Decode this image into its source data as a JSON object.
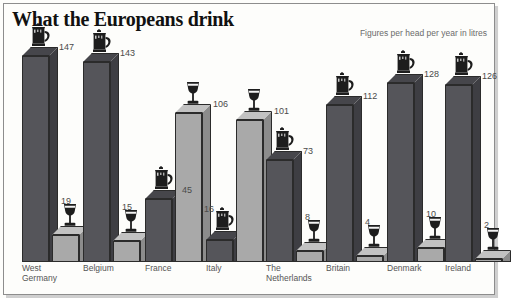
{
  "header": {
    "title": "What the Europeans drink",
    "caption": "Figures per head per year in litres"
  },
  "icons": {
    "beer": "beer-stein-icon",
    "wine": "wine-glass-icon"
  },
  "colors": {
    "beer_face": "#55555a",
    "beer_side": "#3e3e43",
    "beer_top": "#46464b",
    "wine_face": "#a9a9a9",
    "wine_side": "#8c8c8c",
    "wine_top": "#c2c2c2",
    "background": "#fdfdfb",
    "frame": "#8d8d8d",
    "title": "#111111",
    "caption": "#6b6b6b",
    "value_text": "#4a4a4a",
    "label_text": "#555555"
  },
  "chart_data": {
    "type": "bar",
    "title": "What the Europeans drink",
    "subtitle": "Figures per head per year in litres",
    "xlabel": "",
    "ylabel": "Litres per head per year",
    "ylim": [
      0,
      147
    ],
    "grid": false,
    "legend": "none",
    "categories": [
      "West Germany",
      "Belgium",
      "France",
      "Italy",
      "The Netherlands",
      "Britain",
      "Denmark",
      "Ireland"
    ],
    "series": [
      {
        "name": "Beer",
        "icon": "beer-stein-icon",
        "values": [
          147,
          143,
          45,
          16,
          73,
          112,
          128,
          126
        ]
      },
      {
        "name": "Wine",
        "icon": "wine-glass-icon",
        "values": [
          19,
          15,
          106,
          101,
          8,
          4,
          10,
          2
        ]
      }
    ]
  },
  "groups": [
    {
      "label": "West\nGermany",
      "beer": {
        "value": "147"
      },
      "wine": {
        "value": "19"
      }
    },
    {
      "label": "Belgium",
      "beer": {
        "value": "143"
      },
      "wine": {
        "value": "15"
      }
    },
    {
      "label": "France",
      "beer": {
        "value": "45"
      },
      "wine": {
        "value": "106"
      }
    },
    {
      "label": "Italy",
      "beer": {
        "value": "16"
      },
      "wine": {
        "value": "101"
      }
    },
    {
      "label": "The\nNetherlands",
      "beer": {
        "value": "73"
      },
      "wine": {
        "value": "8"
      }
    },
    {
      "label": "Britain",
      "beer": {
        "value": "112"
      },
      "wine": {
        "value": "4"
      }
    },
    {
      "label": "Denmark",
      "beer": {
        "value": "128"
      },
      "wine": {
        "value": "10"
      }
    },
    {
      "label": "Ireland",
      "beer": {
        "value": "126"
      },
      "wine": {
        "value": "2"
      }
    }
  ]
}
